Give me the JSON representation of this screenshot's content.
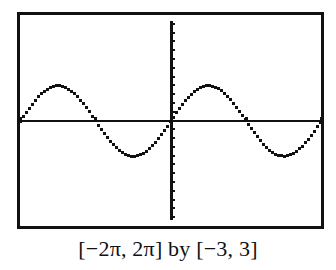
{
  "chart_data": {
    "type": "line",
    "title": "",
    "caption": "[−2π, 2π] by [−3, 3]",
    "function": "y = sin(x)",
    "xlabel": "",
    "ylabel": "",
    "xlim": [
      -6.2832,
      6.2832
    ],
    "ylim": [
      -3,
      3
    ],
    "x_tick_spacing": 3.1416,
    "x_tick_spacing_note": "estimated from ~73px tick spacing; ticks coincide with zero crossings at ±π",
    "y_tick_spacing": 0.25,
    "y_tick_spacing_note": "approximate only — y-axis ticks were estimated (~11 above, ~14 below the x-axis), not individually counted; true Yscl not confirmed",
    "grid": false,
    "axes_visible": true,
    "series": [
      {
        "name": "sin(x)",
        "x": [
          -6.2832,
          -4.7124,
          -3.1416,
          -1.5708,
          0,
          1.5708,
          3.1416,
          4.7124,
          6.2832
        ],
        "values": [
          0,
          1,
          0,
          -1,
          0,
          1,
          0,
          -1,
          0
        ]
      }
    ],
    "style": "pixelated calculator screen, black on white",
    "colors": {
      "curve": "#111111",
      "axes": "#111111",
      "frame": "#111111",
      "background": "#ffffff"
    }
  }
}
